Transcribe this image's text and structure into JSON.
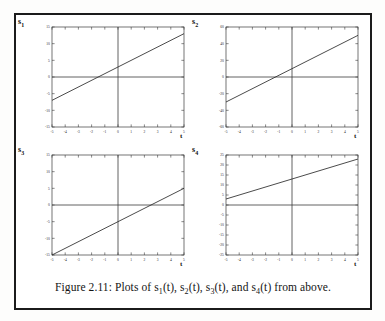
{
  "figure": {
    "caption_prefix": "Figure 2.11: Plots of ",
    "caption_suffix": " from above.",
    "caption_full": "Figure 2.11: Plots of s1(t), s2(t), s3(t), and s4(t) from above.",
    "border_color": "#1b1b1b",
    "background": "#ffffff"
  },
  "axis_style": {
    "line_color": "#3a3a3a",
    "tick_label_color": "#2a2a2a",
    "curve_color": "#2b2b2b",
    "tick_font_size_px": 3.6
  },
  "chart_data": [
    {
      "type": "line",
      "title": "",
      "panel": "top-left",
      "ylabel": "s1",
      "ylabel_base": "s",
      "ylabel_sub": "1",
      "xlabel": "t",
      "x": [
        -5,
        5
      ],
      "values": [
        -7,
        13
      ],
      "slope": 2,
      "intercept": 3,
      "xlim": [
        -5,
        5
      ],
      "ylim": [
        -15,
        15
      ],
      "xticks": [
        -5,
        -4,
        -3,
        -2,
        -1,
        0,
        1,
        2,
        3,
        4,
        5
      ],
      "xticklabels": [
        "-5",
        "-4",
        "-3",
        "-2",
        "-1",
        "0",
        "1",
        "2",
        "3",
        "4",
        "5"
      ],
      "yticks": [
        -15,
        -10,
        -5,
        0,
        5,
        10,
        15
      ],
      "yticklabels": [
        "-15",
        "-10",
        "-5",
        "0",
        "5",
        "10",
        "15"
      ],
      "zero_lines": [
        "horizontal",
        "vertical"
      ],
      "grid": false,
      "legend": "none"
    },
    {
      "type": "line",
      "title": "",
      "panel": "top-right",
      "ylabel": "s2",
      "ylabel_base": "s",
      "ylabel_sub": "2",
      "xlabel": "t",
      "x": [
        -5,
        5
      ],
      "values": [
        -30,
        50
      ],
      "slope": 8,
      "intercept": 10,
      "xlim": [
        -5,
        5
      ],
      "ylim": [
        -60,
        60
      ],
      "xticks": [
        -5,
        -4,
        -3,
        -2,
        -1,
        0,
        1,
        2,
        3,
        4,
        5
      ],
      "xticklabels": [
        "-5",
        "-4",
        "-3",
        "-2",
        "-1",
        "0",
        "1",
        "2",
        "3",
        "4",
        "5"
      ],
      "yticks": [
        -60,
        -40,
        -20,
        0,
        20,
        40,
        60
      ],
      "yticklabels": [
        "-60",
        "-40",
        "-20",
        "0",
        "20",
        "40",
        "60"
      ],
      "zero_lines": [
        "horizontal",
        "vertical"
      ],
      "grid": false,
      "legend": "none"
    },
    {
      "type": "line",
      "title": "",
      "panel": "bottom-left",
      "ylabel": "s3",
      "ylabel_base": "s",
      "ylabel_sub": "3",
      "xlabel": "t",
      "x": [
        -5,
        5
      ],
      "values": [
        -15,
        5
      ],
      "slope": 2,
      "intercept": -5,
      "xlim": [
        -5,
        5
      ],
      "ylim": [
        -15,
        15
      ],
      "xticks": [
        -5,
        -4,
        -3,
        -2,
        -1,
        0,
        1,
        2,
        3,
        4,
        5
      ],
      "xticklabels": [
        "-5",
        "-4",
        "-3",
        "-2",
        "-1",
        "0",
        "1",
        "2",
        "3",
        "4",
        "5"
      ],
      "yticks": [
        -15,
        -10,
        -5,
        0,
        5,
        10,
        15
      ],
      "yticklabels": [
        "-15",
        "-10",
        "-5",
        "0",
        "5",
        "10",
        "15"
      ],
      "zero_lines": [
        "horizontal",
        "vertical"
      ],
      "grid": false,
      "legend": "none"
    },
    {
      "type": "line",
      "title": "",
      "panel": "bottom-right",
      "ylabel": "s4",
      "ylabel_base": "s",
      "ylabel_sub": "4",
      "xlabel": "t",
      "x": [
        -5,
        5
      ],
      "values": [
        3,
        23
      ],
      "slope": 2,
      "intercept": 13,
      "xlim": [
        -5,
        5
      ],
      "ylim": [
        -25,
        25
      ],
      "xticks": [
        -5,
        -4,
        -3,
        -2,
        -1,
        0,
        1,
        2,
        3,
        4,
        5
      ],
      "xticklabels": [
        "-5",
        "-4",
        "-3",
        "-2",
        "-1",
        "0",
        "1",
        "2",
        "3",
        "4",
        "5"
      ],
      "yticks": [
        -25,
        -20,
        -15,
        -10,
        -5,
        0,
        5,
        10,
        15,
        20,
        25
      ],
      "yticklabels": [
        "-25",
        "-20",
        "-15",
        "-10",
        "-5",
        "0",
        "5",
        "10",
        "15",
        "20",
        "25"
      ],
      "zero_lines": [
        "horizontal",
        "vertical"
      ],
      "grid": false,
      "legend": "none"
    }
  ],
  "caption_tokens": [
    {
      "base": "s",
      "sub": "1",
      "tail": "(t), "
    },
    {
      "base": "s",
      "sub": "2",
      "tail": "(t), "
    },
    {
      "base": "s",
      "sub": "3",
      "tail": "(t), and "
    },
    {
      "base": "s",
      "sub": "4",
      "tail": "(t)"
    }
  ]
}
